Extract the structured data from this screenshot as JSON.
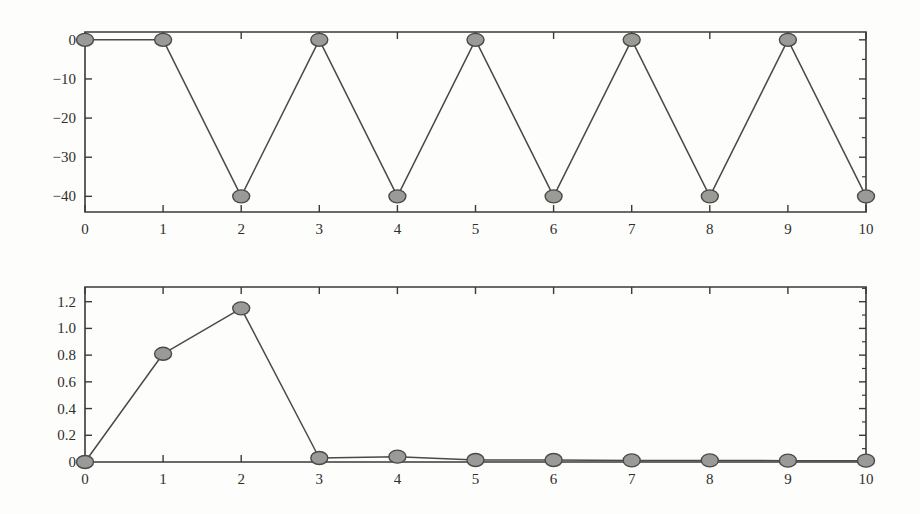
{
  "figure": {
    "background_color": "#fdfdfb",
    "ink_color": "#3a3a38",
    "marker_fill": "#9a9a97",
    "marker_edge": "#4a4a48",
    "panel_count": 2
  },
  "chart_data": [
    {
      "type": "line",
      "id": "top-panel",
      "title": "",
      "subtitle": "",
      "xlabel": "",
      "ylabel": "",
      "x": [
        0,
        1,
        2,
        3,
        4,
        5,
        6,
        7,
        8,
        9,
        10
      ],
      "values": [
        0,
        0,
        -40,
        0,
        -40,
        0,
        -40,
        0,
        -40,
        0,
        -40
      ],
      "series": [
        {
          "name": "phase",
          "values": [
            0,
            0,
            -40,
            0,
            -40,
            0,
            -40,
            0,
            -40,
            0,
            -40
          ]
        }
      ],
      "xlim": [
        0,
        10
      ],
      "ylim": [
        -44,
        2
      ],
      "xticks": [
        0,
        1,
        2,
        3,
        4,
        5,
        6,
        7,
        8,
        9,
        10
      ],
      "xticklabels": [
        "0",
        "1",
        "2",
        "3",
        "4",
        "5",
        "6",
        "7",
        "8",
        "9",
        "10"
      ],
      "yticks": [
        0,
        -10,
        -20,
        -30,
        -40
      ],
      "yticklabels": [
        "0",
        "−10",
        "−20",
        "−30",
        "−40"
      ],
      "y_minor_ticks": [
        -5,
        -15,
        -25,
        -35
      ],
      "grid": false,
      "legend": null,
      "marker": "circle",
      "annotations": []
    },
    {
      "type": "line",
      "id": "bottom-panel",
      "title": "",
      "subtitle": "",
      "xlabel": "",
      "ylabel": "",
      "x": [
        0,
        1,
        2,
        3,
        4,
        5,
        6,
        7,
        8,
        9,
        10
      ],
      "values": [
        0.0,
        0.81,
        1.15,
        0.03,
        0.04,
        0.015,
        0.015,
        0.012,
        0.012,
        0.01,
        0.01
      ],
      "series": [
        {
          "name": "magnitude",
          "values": [
            0.0,
            0.81,
            1.15,
            0.03,
            0.04,
            0.015,
            0.015,
            0.012,
            0.012,
            0.01,
            0.01
          ]
        }
      ],
      "xlim": [
        0,
        10
      ],
      "ylim": [
        0,
        1.31
      ],
      "xticks": [
        0,
        1,
        2,
        3,
        4,
        5,
        6,
        7,
        8,
        9,
        10
      ],
      "xticklabels": [
        "0",
        "1",
        "2",
        "3",
        "4",
        "5",
        "6",
        "7",
        "8",
        "9",
        "10"
      ],
      "yticks": [
        0,
        0.2,
        0.4,
        0.6,
        0.8,
        1.0,
        1.2
      ],
      "yticklabels": [
        "0",
        "0.2",
        "0.4",
        "0.6",
        "0.8",
        "1.0",
        "1.2"
      ],
      "y_minor_ticks": [
        0.1,
        0.3,
        0.5,
        0.7,
        0.9,
        1.1,
        1.3
      ],
      "grid": false,
      "legend": null,
      "marker": "circle",
      "annotations": []
    }
  ]
}
